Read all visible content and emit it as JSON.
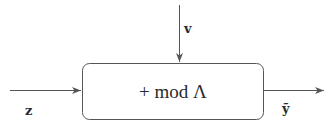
{
  "diagram": {
    "type": "block-diagram",
    "block": {
      "label": "+ mod Λ"
    },
    "inputs": {
      "left": {
        "label": "z"
      },
      "top": {
        "label": "v"
      }
    },
    "output": {
      "label": "ỹ"
    },
    "colors": {
      "stroke": "#555555",
      "text": "#2a2a2a",
      "background": "#ffffff"
    }
  }
}
